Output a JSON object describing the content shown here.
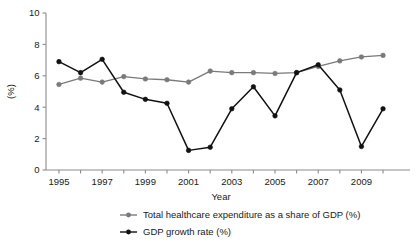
{
  "chart_data": {
    "type": "line",
    "title": "",
    "xlabel": "Year",
    "ylabel": "(%)",
    "x": [
      1995,
      1996,
      1997,
      1998,
      1999,
      2000,
      2001,
      2002,
      2003,
      2004,
      2005,
      2006,
      2007,
      2008,
      2009,
      2010
    ],
    "xtick_labels": [
      "1995",
      "1997",
      "1999",
      "2001",
      "2003",
      "2005",
      "2007",
      "2009"
    ],
    "xticks": [
      1995,
      1997,
      1999,
      2001,
      2003,
      2005,
      2007,
      2009
    ],
    "ytick_labels": [
      "0",
      "2",
      "4",
      "6",
      "8",
      "10"
    ],
    "yticks": [
      0,
      2,
      4,
      6,
      8,
      10
    ],
    "xlim": [
      1994.4,
      2010.6
    ],
    "ylim": [
      0,
      10
    ],
    "grid": false,
    "legend_position": "bottom",
    "series": [
      {
        "name": "Total healthcare expenditure as a share of GDP (%)",
        "color": "#7a7a7a",
        "marker": "circle",
        "values": [
          5.45,
          5.85,
          5.6,
          5.95,
          5.8,
          5.75,
          5.6,
          6.3,
          6.2,
          6.2,
          6.15,
          6.2,
          6.6,
          6.95,
          7.2,
          7.3
        ]
      },
      {
        "name": "GDP growth rate (%)",
        "color": "#111111",
        "marker": "circle",
        "values": [
          6.9,
          6.2,
          7.05,
          4.95,
          4.5,
          4.25,
          1.25,
          1.45,
          3.9,
          5.3,
          3.45,
          6.2,
          6.7,
          5.1,
          1.5,
          3.9
        ]
      }
    ]
  },
  "legend": {
    "items": [
      {
        "label": "Total healthcare expenditure as a share of GDP (%)",
        "color": "#7a7a7a"
      },
      {
        "label": "GDP growth rate (%)",
        "color": "#111111"
      }
    ]
  }
}
